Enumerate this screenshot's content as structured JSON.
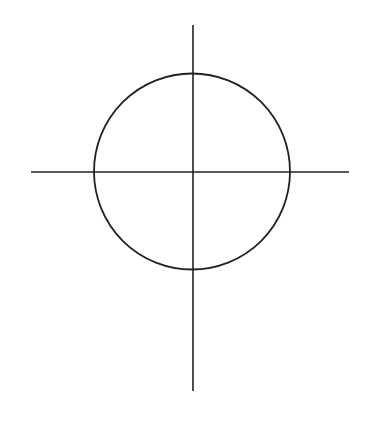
{
  "diagram": {
    "background": "#ffffff",
    "stroke_color": "#222222",
    "circle": {
      "cx": 192,
      "cy": 171.5,
      "r": 98,
      "stroke_width": 1.8
    },
    "horizontal_axis": {
      "x1": 31,
      "y1": 172,
      "x2": 349,
      "y2": 172,
      "stroke_width": 1.6
    },
    "vertical_axis": {
      "x1": 193,
      "y1": 25,
      "x2": 193,
      "y2": 391,
      "stroke_width": 1.6
    }
  }
}
